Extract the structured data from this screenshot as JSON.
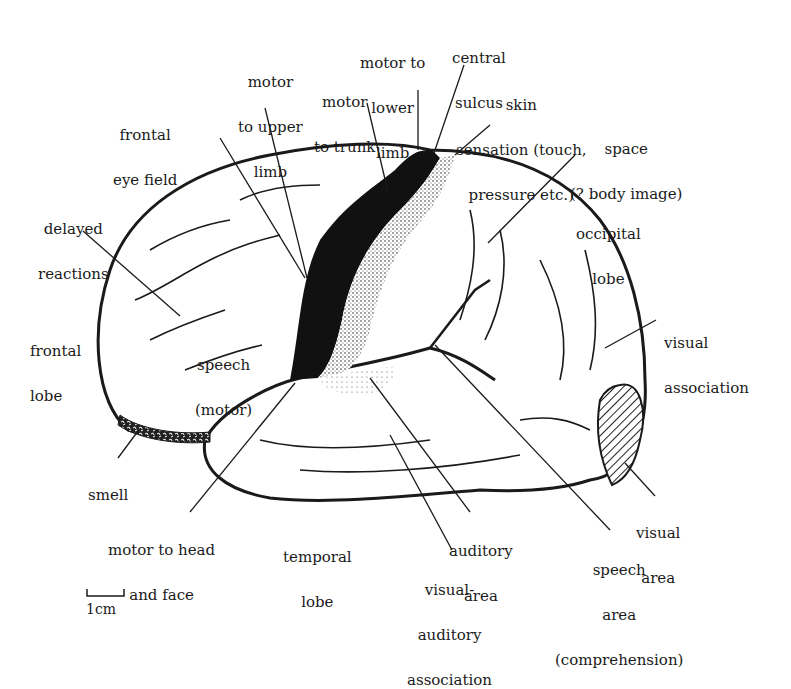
{
  "labels": {
    "motor_upper_limb": [
      "motor",
      "to upper",
      "limb"
    ],
    "motor_trunk": [
      "motor",
      "to trunk"
    ],
    "motor_lower_limb": [
      "motor to",
      "lower",
      "limb"
    ],
    "central_sulcus": [
      "central",
      "sulcus"
    ],
    "skin_sensation": [
      "skin",
      "sensation (touch,",
      "pressure etc.)"
    ],
    "frontal_eye_field": [
      "frontal",
      "eye field"
    ],
    "space_body_image": [
      "space",
      "(? body image)"
    ],
    "delayed_reactions": [
      "delayed",
      "reactions"
    ],
    "occipital_lobe": [
      "occipital",
      "lobe"
    ],
    "frontal_lobe": [
      "frontal",
      "lobe"
    ],
    "speech_motor": [
      "speech",
      "(motor)"
    ],
    "visual_association": [
      "visual",
      "association"
    ],
    "smell": [
      "smell"
    ],
    "visual_area": [
      "visual",
      "area"
    ],
    "motor_head_face": [
      "motor to head",
      "and face"
    ],
    "temporal_lobe": [
      "temporal",
      "lobe"
    ],
    "auditory_area": [
      "auditory",
      "area"
    ],
    "speech_comprehension": [
      "speech",
      "area",
      "(comprehension)"
    ],
    "visual_auditory_association": [
      "visual-",
      "auditory",
      "association"
    ],
    "scale_bar": [
      "1cm"
    ]
  },
  "colors": {
    "ink": "#1a1a1a",
    "background": "#ffffff"
  }
}
